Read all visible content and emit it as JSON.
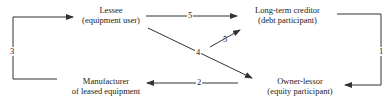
{
  "nodes": {
    "lessee": {
      "line1": "Lessee",
      "line2": "(equipment user)"
    },
    "creditor": {
      "line1": "Long-term creditor",
      "line2": "(debt participant)"
    },
    "manufacturer": {
      "line1": "Manufacturer",
      "line2": "of leased equipment"
    },
    "owner": {
      "line1": "Owner-lessor",
      "line2": "(equity participant)"
    }
  },
  "edges": [
    {
      "id": "e1",
      "label": "1",
      "from": "long-term-creditor",
      "to": "owner-lessor"
    },
    {
      "id": "e2",
      "label": "2",
      "from": "owner-lessor",
      "to": "manufacturer"
    },
    {
      "id": "e3",
      "label": "3",
      "from": "manufacturer",
      "to": "lessee"
    },
    {
      "id": "e4",
      "label": "4",
      "from": "lessee",
      "to": "owner-lessor"
    },
    {
      "id": "e5a",
      "label": "5",
      "from": "lessee",
      "to": "long-term-creditor"
    },
    {
      "id": "e5b",
      "label": "5",
      "from": "owner-lessor",
      "to": "long-term-creditor"
    }
  ],
  "colors": {
    "line": "#333333",
    "text": "#222222",
    "background": "#ffffff"
  }
}
